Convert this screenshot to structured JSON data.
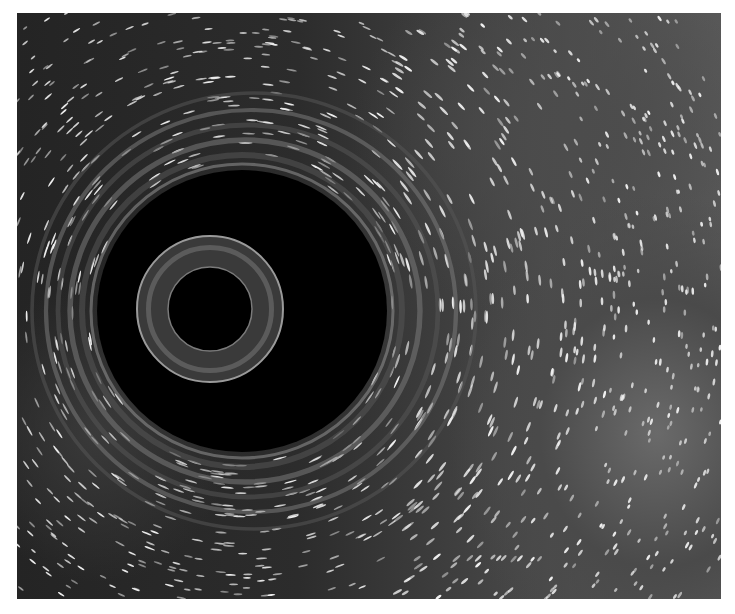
{
  "image": {
    "description": "Grayscale render of a black hole with gravitationally lensed, motion-streaked star field",
    "palette": {
      "background": "#ffffff",
      "void": "#000000",
      "stars": "#f2f2f2",
      "glow": "#6a6a6a"
    },
    "frame": {
      "x": 17,
      "y": 13,
      "width": 704,
      "height": 586
    },
    "shadow": {
      "cx": 242,
      "cy": 311,
      "rx": 145,
      "ry": 141
    },
    "inner_ring": {
      "cx": 210,
      "cy": 309,
      "r_outer": 73,
      "r_inner": 42
    },
    "swirl_rings": [
      {
        "r": 160
      },
      {
        "r": 175
      },
      {
        "r": 190
      },
      {
        "r": 205
      },
      {
        "r": 222
      }
    ]
  }
}
